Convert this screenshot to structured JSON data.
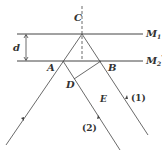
{
  "diagram": {
    "type": "optics-interference",
    "colors": {
      "stroke": "#444444",
      "text": "#333333",
      "background": "#ffffff"
    },
    "mirrors": [
      {
        "id": "M1",
        "label": "M",
        "sub": "1",
        "prime": ""
      },
      {
        "id": "M2prime",
        "label": "M",
        "sub": "2",
        "prime": "′"
      }
    ],
    "points": {
      "C": "C",
      "A": "A",
      "B": "B",
      "D": "D",
      "E": "E"
    },
    "distance_label": "d",
    "rays": [
      {
        "id": "ray1",
        "label": "(1)"
      },
      {
        "id": "ray2",
        "label": "(2)"
      }
    ]
  }
}
